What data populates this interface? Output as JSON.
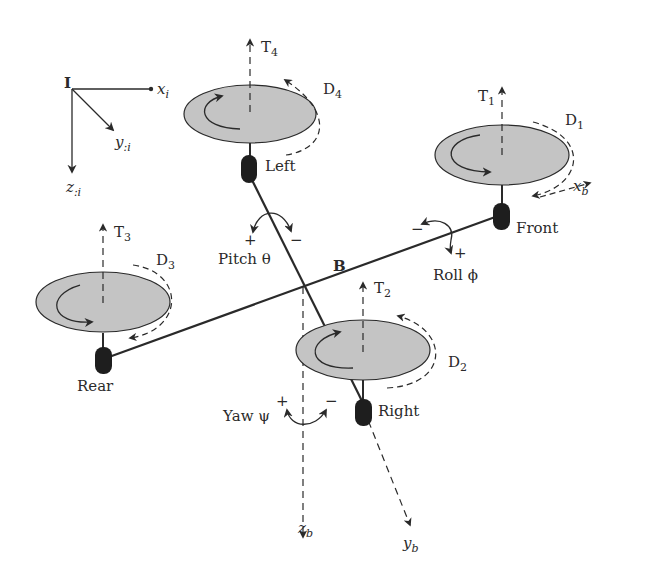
{
  "diagram": {
    "type": "quadrotor-coordinate-frames",
    "colors": {
      "rotor_fill": "#c4c4c4",
      "line": "#2a2a2a",
      "motor": "#1e1e1e",
      "background": "#ffffff"
    },
    "inertial_frame": {
      "origin_label": "I",
      "x_label": "x",
      "x_sub": "i",
      "y_label": "y",
      "y_sub": ":i",
      "z_label": "z",
      "z_sub": ":i"
    },
    "body_frame": {
      "origin_label": "B",
      "x_label": "x",
      "x_sub": "b",
      "y_label": "y",
      "y_sub": "b",
      "z_label": "z",
      "z_sub": "b"
    },
    "rotors": [
      {
        "motor_label": "Front",
        "thrust": "T",
        "thrust_sub": "1",
        "drag": "D",
        "drag_sub": "1"
      },
      {
        "motor_label": "Right",
        "thrust": "T",
        "thrust_sub": "2",
        "drag": "D",
        "drag_sub": "2"
      },
      {
        "motor_label": "Rear",
        "thrust": "T",
        "thrust_sub": "3",
        "drag": "D",
        "drag_sub": "3"
      },
      {
        "motor_label": "Left",
        "thrust": "T",
        "thrust_sub": "4",
        "drag": "D",
        "drag_sub": "4"
      }
    ],
    "rotations": {
      "pitch": {
        "label": "Pitch θ",
        "plus": "+",
        "minus": "−"
      },
      "roll": {
        "label": "Roll ϕ",
        "plus": "+",
        "minus": "−"
      },
      "yaw": {
        "label": "Yaw ψ",
        "plus": "+",
        "minus": "−"
      }
    }
  }
}
